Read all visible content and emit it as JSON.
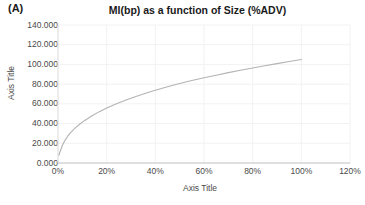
{
  "panel": {
    "label": "(A)"
  },
  "chart_data": {
    "type": "line",
    "title": "MI(bp) as a function of Size (%ADV)",
    "xlabel": "Axis Title",
    "ylabel": "Axis Title",
    "xlim": [
      0,
      120
    ],
    "ylim": [
      0,
      140
    ],
    "grid": true,
    "legend": false,
    "legend_position": "none",
    "line_color": "#b3b3b3",
    "xticks": [
      0,
      20,
      40,
      60,
      80,
      100,
      120
    ],
    "xtick_labels": [
      "0%",
      "20%",
      "40%",
      "60%",
      "80%",
      "100%",
      "120%"
    ],
    "yticks": [
      0,
      20,
      40,
      60,
      80,
      100,
      120,
      140
    ],
    "ytick_labels": [
      "0.000",
      "20.000",
      "40.000",
      "60.000",
      "80.000",
      "100.000",
      "120.000",
      "140.000"
    ],
    "series": [
      {
        "name": "MI(bp)",
        "x": [
          0.4,
          1,
          2,
          3,
          4,
          5,
          7,
          9,
          11,
          14,
          17,
          20,
          24,
          28,
          32,
          36,
          40,
          45,
          50,
          55,
          60,
          65,
          70,
          75,
          80,
          85,
          90,
          95,
          100
        ],
        "y": [
          8.0,
          12.7,
          19.0,
          23.5,
          27.2,
          30.3,
          35.4,
          39.6,
          43.2,
          48.0,
          52.1,
          55.7,
          60.1,
          64.0,
          67.5,
          70.8,
          73.8,
          77.3,
          80.6,
          83.6,
          86.4,
          89.1,
          91.7,
          94.1,
          96.4,
          98.7,
          100.8,
          102.9,
          105.0
        ]
      }
    ],
    "note": "Concave increasing market-impact curve; starts near 8 bp at minimal size and reaches about 127 bp at 100% ADV"
  }
}
